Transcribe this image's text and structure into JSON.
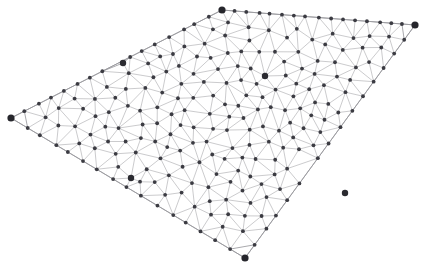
{
  "figure": {
    "name": "triangulated-mesh-graph",
    "type": "node-link-mesh",
    "width": 424,
    "height": 268,
    "background_color": "#ffffff",
    "edge_color": "#b5b5b8",
    "boundary_edge_color": "#9a9a9e",
    "node_color": "#3b3b42",
    "large_node_color": "#2a2a30",
    "corner_node_color": "#26262c",
    "edge_stroke_width": 0.7,
    "node_radius": 1.9,
    "large_node_radius": 3.2,
    "corner_node_radius": 3.6,
    "domain_shape": "quadrilateral",
    "corner_points": [
      {
        "id": "corner-left",
        "x": 11,
        "y": 118
      },
      {
        "id": "corner-top",
        "x": 222,
        "y": 10
      },
      {
        "id": "corner-right",
        "x": 415,
        "y": 25
      },
      {
        "id": "corner-bottom",
        "x": 245,
        "y": 258
      }
    ],
    "emphasized_points": [
      {
        "id": "hub-upper-left",
        "x": 123,
        "y": 63
      },
      {
        "id": "hub-upper-right",
        "x": 265,
        "y": 76
      },
      {
        "id": "hub-lower-left",
        "x": 131,
        "y": 178
      },
      {
        "id": "hub-lower-right",
        "x": 345,
        "y": 193
      }
    ],
    "mesh_seed": 20240611,
    "interior_point_count": 300,
    "boundary_samples_per_edge": 16
  },
  "chart_data": {
    "type": "scatter",
    "title": "",
    "xlabel": "",
    "ylabel": "",
    "xlim": [
      0,
      424
    ],
    "ylim": [
      0,
      268
    ],
    "grid": false,
    "legend": null
  }
}
